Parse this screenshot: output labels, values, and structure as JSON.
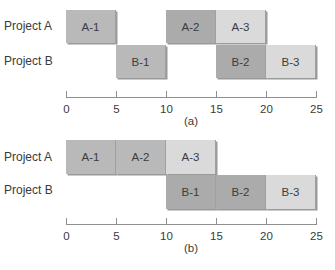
{
  "chart_data": [
    {
      "type": "gantt",
      "caption": "(a)",
      "rows": [
        "Project A",
        "Project B"
      ],
      "xlim": [
        0,
        25
      ],
      "xticks": [
        0,
        5,
        10,
        15,
        20,
        25
      ],
      "tasks": [
        {
          "label": "A-1",
          "row": "Project A",
          "start": 0,
          "end": 5,
          "color": "#b9b9b9"
        },
        {
          "label": "A-2",
          "row": "Project A",
          "start": 10,
          "end": 15,
          "color": "#ababab"
        },
        {
          "label": "A-3",
          "row": "Project A",
          "start": 15,
          "end": 20,
          "color": "#dadada"
        },
        {
          "label": "B-1",
          "row": "Project B",
          "start": 5,
          "end": 10,
          "color": "#b9b9b9"
        },
        {
          "label": "B-2",
          "row": "Project B",
          "start": 15,
          "end": 20,
          "color": "#ababab"
        },
        {
          "label": "B-3",
          "row": "Project B",
          "start": 20,
          "end": 25,
          "color": "#dadada"
        }
      ]
    },
    {
      "type": "gantt",
      "caption": "(b)",
      "rows": [
        "Project A",
        "Project B"
      ],
      "xlim": [
        0,
        25
      ],
      "xticks": [
        0,
        5,
        10,
        15,
        20,
        25
      ],
      "tasks": [
        {
          "label": "A-1",
          "row": "Project A",
          "start": 0,
          "end": 5,
          "color": "#b9b9b9"
        },
        {
          "label": "A-2",
          "row": "Project A",
          "start": 5,
          "end": 10,
          "color": "#b9b9b9"
        },
        {
          "label": "A-3",
          "row": "Project A",
          "start": 10,
          "end": 15,
          "color": "#dadada"
        },
        {
          "label": "B-1",
          "row": "Project B",
          "start": 10,
          "end": 15,
          "color": "#ababab"
        },
        {
          "label": "B-2",
          "row": "Project B",
          "start": 15,
          "end": 20,
          "color": "#ababab"
        },
        {
          "label": "B-3",
          "row": "Project B",
          "start": 20,
          "end": 25,
          "color": "#dadada"
        }
      ]
    }
  ]
}
